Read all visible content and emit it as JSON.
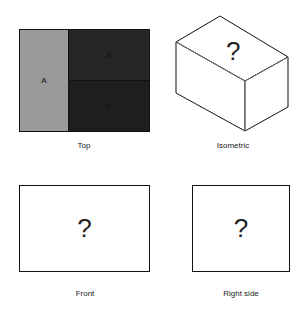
{
  "views": {
    "top": {
      "label": "Top",
      "regions": [
        {
          "id": "A",
          "label": "A",
          "color": "#9a9a9a"
        },
        {
          "id": "B",
          "label": "B",
          "color": "#262626"
        },
        {
          "id": "C",
          "label": "C",
          "color": "#1e1e1e"
        }
      ]
    },
    "isometric": {
      "label": "Isometric",
      "content": "?"
    },
    "front": {
      "label": "Front",
      "content": "?"
    },
    "right_side": {
      "label": "Right side",
      "content": "?"
    }
  }
}
